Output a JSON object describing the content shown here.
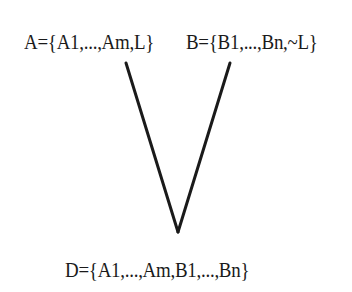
{
  "diagram": {
    "type": "resolution-tree",
    "nodes": [
      {
        "id": "A",
        "label": "A={A1,...,Am,L}"
      },
      {
        "id": "B",
        "label": "B={B1,...,Bn,~L}"
      },
      {
        "id": "D",
        "label": "D={A1,...,Am,B1,...,Bn}"
      }
    ],
    "edges": [
      {
        "from": "A",
        "to": "D"
      },
      {
        "from": "B",
        "to": "D"
      }
    ],
    "colors": {
      "ink": "#1a1a1a",
      "background": "#ffffff"
    }
  }
}
